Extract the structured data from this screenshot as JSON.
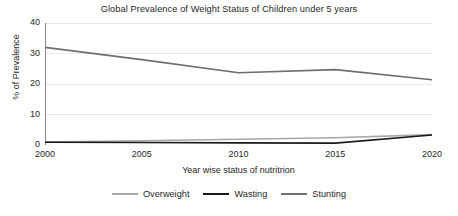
{
  "chart_data": {
    "type": "line",
    "title": "Global Prevalence of Weight Status of Children under 5 years",
    "xlabel": "Year wise status of nutritrion",
    "ylabel": "% of Prevalence",
    "x": [
      2000,
      2005,
      2010,
      2015,
      2020
    ],
    "xtick_labels": [
      "2000",
      "2005",
      "2010",
      "2015",
      "2020"
    ],
    "ytick_labels": [
      "0",
      "10",
      "20",
      "30",
      "40"
    ],
    "yticks": [
      0,
      10,
      20,
      30,
      40
    ],
    "xlim": [
      2000,
      2020
    ],
    "ylim": [
      0,
      40
    ],
    "grid": true,
    "grid_axis": "y",
    "legend_position": "bottom",
    "series": [
      {
        "name": "Overweight",
        "color": "#a6a6a6",
        "values": [
          1.0,
          1.4,
          1.9,
          2.4,
          3.4
        ]
      },
      {
        "name": "Wasting",
        "color": "#1a1a1a",
        "values": [
          0.9,
          0.8,
          0.7,
          0.6,
          3.3
        ]
      },
      {
        "name": "Stunting",
        "color": "#6e6e6e",
        "values": [
          32.0,
          28.0,
          23.7,
          24.7,
          21.4
        ]
      }
    ]
  },
  "legend": {
    "items": [
      {
        "label": "Overweight",
        "color": "#a6a6a6"
      },
      {
        "label": "Wasting",
        "color": "#1a1a1a"
      },
      {
        "label": "Stunting",
        "color": "#6e6e6e"
      }
    ]
  },
  "colors": {
    "background": "#ffffff",
    "axis": "#8c8c8c",
    "grid": "#e8e8e8",
    "text": "#1f1f1f"
  }
}
